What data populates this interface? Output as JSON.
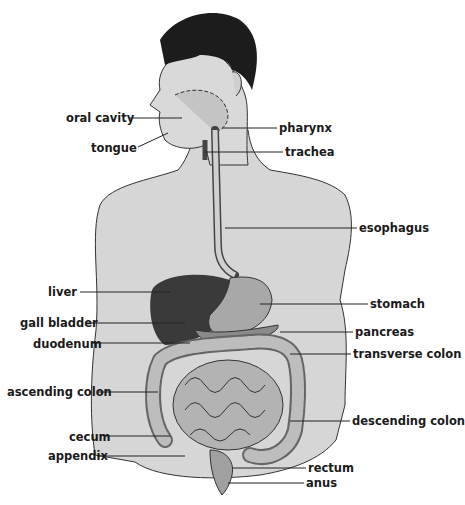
{
  "diagram": {
    "labels_left": [
      {
        "id": "oral-cavity",
        "text": "oral cavity",
        "x": 66,
        "y": 111
      },
      {
        "id": "tongue",
        "text": "tongue",
        "x": 91,
        "y": 141
      },
      {
        "id": "liver",
        "text": "liver",
        "x": 48,
        "y": 285
      },
      {
        "id": "gall-bladder",
        "text": "gall bladder",
        "x": 20,
        "y": 316
      },
      {
        "id": "duodenum",
        "text": "duodenum",
        "x": 33,
        "y": 337
      },
      {
        "id": "ascending-colon",
        "text": "ascending colon",
        "x": 7,
        "y": 385
      },
      {
        "id": "cecum",
        "text": "cecum",
        "x": 69,
        "y": 430
      },
      {
        "id": "appendix",
        "text": "appendix",
        "x": 48,
        "y": 449
      }
    ],
    "labels_right": [
      {
        "id": "pharynx",
        "text": "pharynx",
        "x": 279,
        "y": 121
      },
      {
        "id": "trachea",
        "text": "trachea",
        "x": 285,
        "y": 145
      },
      {
        "id": "esophagus",
        "text": "esophagus",
        "x": 359,
        "y": 214
      },
      {
        "id": "stomach",
        "text": "stomach",
        "x": 370,
        "y": 295
      },
      {
        "id": "pancreas",
        "text": "pancreas",
        "x": 355,
        "y": 323
      },
      {
        "id": "transverse-colon",
        "text": "transverse colon",
        "x": 353,
        "y": 347
      },
      {
        "id": "descending-colon",
        "text": "descending colon",
        "x": 352,
        "y": 415
      },
      {
        "id": "rectum",
        "text": "rectum",
        "x": 308,
        "y": 461
      },
      {
        "id": "anus",
        "text": "anus",
        "x": 306,
        "y": 476
      }
    ]
  }
}
